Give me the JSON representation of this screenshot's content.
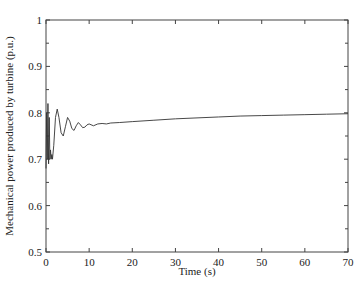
{
  "chart_data": {
    "type": "line",
    "title": "",
    "xlabel": "Time (s)",
    "ylabel": "Mechanical power produced by turbine (p.u.)",
    "xlim": [
      0,
      70
    ],
    "ylim": [
      0.5,
      1
    ],
    "xticks": [
      0,
      10,
      20,
      30,
      40,
      50,
      60,
      70
    ],
    "yticks": [
      0.5,
      0.6,
      0.7,
      0.8,
      0.9,
      1
    ],
    "yticks_minor": [
      0.55,
      0.65,
      0.75,
      0.85,
      0.95
    ],
    "grid": false,
    "legend": null,
    "series": [
      {
        "name": "Mechanical power",
        "x": [
          0,
          0.15,
          0.3,
          0.45,
          0.6,
          0.75,
          0.9,
          1.05,
          1.2,
          1.35,
          1.5,
          1.8,
          2.2,
          2.6,
          3.0,
          3.5,
          4.0,
          4.5,
          5.0,
          5.5,
          6.0,
          6.5,
          7.0,
          7.5,
          8.0,
          8.5,
          9.0,
          9.5,
          10,
          11,
          12,
          13,
          14,
          15,
          17,
          20,
          25,
          30,
          35,
          40,
          45,
          50,
          55,
          60,
          65,
          70
        ],
        "y": [
          0.68,
          0.8,
          0.7,
          0.82,
          0.69,
          0.79,
          0.7,
          0.72,
          0.7,
          0.71,
          0.7,
          0.73,
          0.79,
          0.808,
          0.79,
          0.757,
          0.75,
          0.77,
          0.79,
          0.782,
          0.766,
          0.762,
          0.772,
          0.779,
          0.774,
          0.768,
          0.769,
          0.774,
          0.776,
          0.772,
          0.776,
          0.777,
          0.776,
          0.778,
          0.779,
          0.781,
          0.784,
          0.787,
          0.789,
          0.791,
          0.793,
          0.794,
          0.795,
          0.796,
          0.797,
          0.798
        ]
      }
    ]
  },
  "labels": {
    "xlabel": "Time (s)",
    "ylabel": "Mechanical power produced by turbine (p.u.)"
  }
}
